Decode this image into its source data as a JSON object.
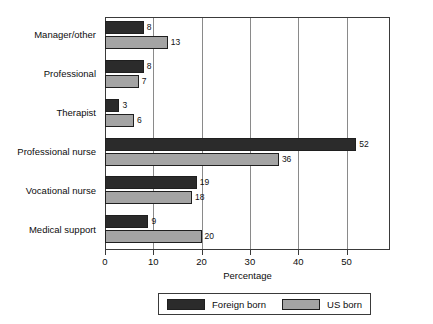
{
  "chart_data": {
    "type": "bar",
    "orientation": "horizontal",
    "title": "",
    "subtitle": "",
    "xlabel": "Percentage",
    "ylabel": "",
    "xlim": [
      0,
      59
    ],
    "xticks": [
      0,
      10,
      20,
      30,
      40,
      50
    ],
    "xtick_labels": [
      "0",
      "10",
      "20",
      "30",
      "40",
      "50"
    ],
    "grid": true,
    "grid_axis": "x",
    "legend_position": "bottom",
    "categories": [
      "Manager/other",
      "Professional",
      "Therapist",
      "Professional nurse",
      "Vocational nurse",
      "Medical support"
    ],
    "series": [
      {
        "name": "Foreign born",
        "color": "#2b2b2b",
        "values": [
          8,
          8,
          3,
          52,
          19,
          9
        ],
        "value_labels": [
          "8",
          "8",
          "3",
          "52",
          "19",
          "9"
        ]
      },
      {
        "name": "US born",
        "color": "#a4a4a4",
        "values": [
          13,
          7,
          6,
          36,
          18,
          20
        ],
        "value_labels": [
          "13",
          "7",
          "6",
          "36",
          "18",
          "20"
        ]
      }
    ],
    "annotations": []
  },
  "legend": {
    "entries": [
      {
        "label": "Foreign born",
        "swatch": "legend-swatch-foreign-born"
      },
      {
        "label": "US born",
        "swatch": "legend-swatch-us-born"
      }
    ]
  },
  "colors": {
    "foreign_born": "#2b2b2b",
    "us_born": "#a4a4a4",
    "axis": "#3a3a3a",
    "gridline": "#8a8a8a",
    "text": "#0d0d0d",
    "background": "#ffffff"
  }
}
